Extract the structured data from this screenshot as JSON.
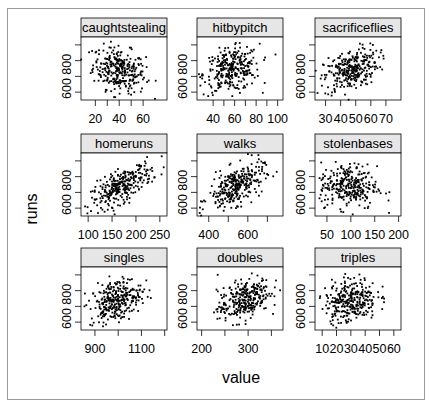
{
  "chart_data": {
    "type": "scatter",
    "layout": "trellis 3x3",
    "xlabel": "value",
    "ylabel": "runs",
    "ylim": [
      550,
      950
    ],
    "y_ticks": [
      600,
      700,
      800,
      900
    ],
    "y_tick_labels": [
      "600",
      "",
      "800",
      ""
    ],
    "grid": false,
    "legend": null,
    "strip_color": "#e6e6e6",
    "point_color": "#000000",
    "panels": [
      {
        "name": "caughtstealing",
        "xlim": [
          8,
          80
        ],
        "x_ticks": [
          20,
          30,
          40,
          50,
          60
        ],
        "x_tick_labels": [
          "20",
          "",
          "40",
          "",
          "60"
        ],
        "x_mean": 40,
        "x_sd": 11,
        "correlation": -0.25,
        "n": 300
      },
      {
        "name": "hitbypitch",
        "xlim": [
          25,
          105
        ],
        "x_ticks": [
          40,
          50,
          60,
          70,
          80,
          90,
          100
        ],
        "x_tick_labels": [
          "40",
          "",
          "60",
          "",
          "80",
          "",
          "100"
        ],
        "x_mean": 57,
        "x_sd": 13,
        "correlation": 0.2,
        "n": 300
      },
      {
        "name": "sacrificeflies",
        "xlim": [
          23,
          80
        ],
        "x_ticks": [
          30,
          40,
          50,
          60,
          70
        ],
        "x_tick_labels": [
          "30",
          "40",
          "50",
          "60",
          "70"
        ],
        "x_mean": 47,
        "x_sd": 9,
        "correlation": 0.4,
        "n": 300
      },
      {
        "name": "homeruns",
        "xlim": [
          85,
          265
        ],
        "x_ticks": [
          100,
          150,
          200,
          250
        ],
        "x_tick_labels": [
          "100",
          "150",
          "200",
          "250"
        ],
        "x_mean": 170,
        "x_sd": 32,
        "correlation": 0.7,
        "n": 300
      },
      {
        "name": "walks",
        "xlim": [
          340,
          780
        ],
        "x_ticks": [
          400,
          500,
          600,
          700
        ],
        "x_tick_labels": [
          "400",
          "",
          "600",
          ""
        ],
        "x_mean": 540,
        "x_sd": 70,
        "correlation": 0.55,
        "n": 300
      },
      {
        "name": "stolenbases",
        "xlim": [
          25,
          205
        ],
        "x_ticks": [
          50,
          100,
          150,
          200
        ],
        "x_tick_labels": [
          "50",
          "100",
          "150",
          "200"
        ],
        "x_mean": 95,
        "x_sd": 30,
        "correlation": -0.1,
        "n": 300
      },
      {
        "name": "singles",
        "xlim": [
          840,
          1210
        ],
        "x_ticks": [
          900,
          1000,
          1100,
          1200
        ],
        "x_tick_labels": [
          "900",
          "",
          "1100",
          ""
        ],
        "x_mean": 990,
        "x_sd": 55,
        "correlation": 0.35,
        "n": 300
      },
      {
        "name": "doubles",
        "xlim": [
          190,
          375
        ],
        "x_ticks": [
          200,
          250,
          300,
          350
        ],
        "x_tick_labels": [
          "200",
          "",
          "300",
          ""
        ],
        "x_mean": 290,
        "x_sd": 28,
        "correlation": 0.45,
        "n": 300
      },
      {
        "name": "triples",
        "xlim": [
          5,
          65
        ],
        "x_ticks": [
          10,
          20,
          30,
          40,
          50,
          60
        ],
        "x_tick_labels": [
          "10",
          "20",
          "30",
          "40",
          "50",
          "60"
        ],
        "x_mean": 30,
        "x_sd": 9,
        "correlation": 0.15,
        "n": 300
      }
    ],
    "runs_mean": 740,
    "runs_sd": 70
  }
}
